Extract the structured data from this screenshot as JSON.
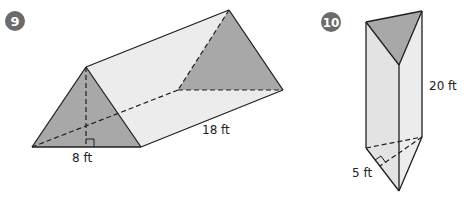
{
  "problems": [
    {
      "number": "9",
      "shape": "triangular-prism-horizontal",
      "labels": {
        "base": "8 ft",
        "length": "18 ft"
      }
    },
    {
      "number": "10",
      "shape": "triangular-prism-vertical",
      "labels": {
        "height": "20 ft",
        "base": "5 ft"
      }
    }
  ],
  "colors": {
    "badge": "#6b6b6b",
    "dark_face": "#a8a8a8",
    "light_face": "#e3e3e3",
    "lighter_face": "#ececec",
    "stroke": "#1f1f1f"
  }
}
